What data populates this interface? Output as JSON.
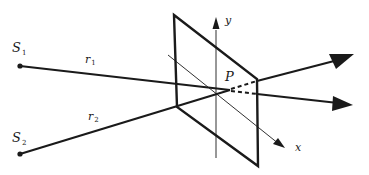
{
  "diagram": {
    "type": "two-source interference geometry",
    "colors": {
      "ink": "#1a1a1a",
      "background": "#ffffff"
    },
    "sources": [
      {
        "id": "S1",
        "label": "S",
        "subscript": "1",
        "x": 20,
        "y": 66
      },
      {
        "id": "S2",
        "label": "S",
        "subscript": "2",
        "x": 20,
        "y": 154
      }
    ],
    "paths": [
      {
        "id": "r1",
        "label": "r",
        "subscript": "1"
      },
      {
        "id": "r2",
        "label": "r",
        "subscript": "2"
      }
    ],
    "point": {
      "label": "P"
    },
    "axes": {
      "x": {
        "label": "x"
      },
      "y": {
        "label": "y"
      }
    },
    "plane": {
      "shape": "parallelogram",
      "description": "observation screen"
    }
  }
}
